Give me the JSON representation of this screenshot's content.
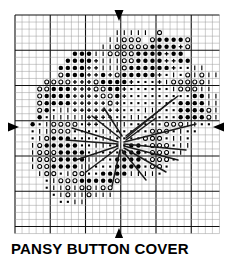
{
  "title": "PANSY BUTTON COVER",
  "chart_data": {
    "type": "heatmap",
    "title": "PANSY BUTTON COVER",
    "xlabel": "",
    "ylabel": "",
    "subtype": "cross-stitch-chart",
    "grid": {
      "cols": 29,
      "rows": 31,
      "cell_px": 7.05,
      "origin_x": 15,
      "origin_y": 15,
      "minor_color": "#9a9a9a",
      "major_color": "#111111",
      "major_every": 5,
      "grid_on": true
    },
    "symbol_legend": [
      {
        "key": "F",
        "name": "filled-circle",
        "glyph": "●",
        "color": "#000000"
      },
      {
        "key": "O",
        "name": "open-circle",
        "glyph": "○",
        "color": "#000000"
      },
      {
        "key": "P",
        "name": "plus-sign",
        "glyph": "+",
        "color": "#000000"
      },
      {
        "key": "I",
        "name": "vertical-bar",
        "glyph": "|",
        "color": "#000000"
      },
      {
        "key": "D",
        "name": "small-dot",
        "glyph": "·",
        "color": "#000000"
      },
      {
        "key": ".",
        "name": "empty-cell",
        "glyph": "",
        "color": "#ffffff"
      }
    ],
    "cells": [
      ".............................",
      ".............................",
      "..............IIIII.O........",
      ".............IIOOO.OFFFFO....",
      "............IIOOOOOFFFFPO....",
      "........FFFIIOOOOFFFFPFF.....",
      ".......FFFFPIIIOOFFFFPPFF....",
      "......FFFFPPIIIOFFFFFFPDDII..",
      "......OFFFPPFPOFFFFFPDIDOIOII",
      "....OOOOPPPOFFFFPDDDPIOOOOOI.",
      "...OOFFFPPPOOFFPDDDDDDIOOOII.",
      "...OFFFFPPPPOOFPDDDDDDDDDFFII",
      "...OFFFFPPPPPOPDDDDDDDDFFFFII",
      "...OFDIIPPPPPPPDDDIIDDDFFFFOI",
      "...FDIIIIIPPPPDDIIDDDDDFFFFOI",
      "..FDIOOOODPPDIIIDDDDDOOOIIDD.",
      "..DIIOOODDDDIIDDDDDOOODIDD...",
      "..DIOFFFDDDDIIDDDDOOODIID....",
      "..IOFFFFFDDIIDDDFFDOOODII....",
      "..IOOOFFFFDIDDDFFFDOOODI.....",
      "..IOOOFFFFIIDDFFFFDOOOD......",
      "..IOOFFFFIIDDDFFFFDOOD.......",
      "...IOODIOODDFFFFIIIID........",
      "....DIOOOFFFFFO..............",
      "....DIIOIOOIOO...............",
      ".....DIOIIOIII...............",
      "......DDII...................",
      ".............................",
      ".............................",
      ".............................",
      "............................."
    ],
    "backstitch": [
      {
        "x1": 126,
        "y1": 136,
        "x2": 178,
        "y2": 96
      },
      {
        "x1": 126,
        "y1": 138,
        "x2": 172,
        "y2": 100
      },
      {
        "x1": 126,
        "y1": 140,
        "x2": 156,
        "y2": 118
      },
      {
        "x1": 124,
        "y1": 142,
        "x2": 196,
        "y2": 124
      },
      {
        "x1": 124,
        "y1": 144,
        "x2": 186,
        "y2": 150
      },
      {
        "x1": 124,
        "y1": 146,
        "x2": 178,
        "y2": 160
      },
      {
        "x1": 124,
        "y1": 148,
        "x2": 166,
        "y2": 172
      },
      {
        "x1": 122,
        "y1": 150,
        "x2": 146,
        "y2": 180
      },
      {
        "x1": 120,
        "y1": 150,
        "x2": 112,
        "y2": 186
      },
      {
        "x1": 118,
        "y1": 148,
        "x2": 86,
        "y2": 172
      },
      {
        "x1": 118,
        "y1": 146,
        "x2": 76,
        "y2": 160
      },
      {
        "x1": 118,
        "y1": 144,
        "x2": 66,
        "y2": 140
      },
      {
        "x1": 118,
        "y1": 142,
        "x2": 72,
        "y2": 128
      },
      {
        "x1": 120,
        "y1": 138,
        "x2": 92,
        "y2": 116
      },
      {
        "x1": 122,
        "y1": 136,
        "x2": 104,
        "y2": 108
      }
    ],
    "center_markers": [
      {
        "name": "top-center-arrow",
        "direction": "down",
        "x": 119,
        "y": 10
      },
      {
        "name": "bottom-center-arrow",
        "direction": "up",
        "x": 119,
        "y": 228
      },
      {
        "name": "left-center-arrow",
        "direction": "right",
        "x": 8,
        "y": 127
      },
      {
        "name": "right-center-arrow",
        "direction": "left",
        "x": 224,
        "y": 127
      }
    ]
  }
}
